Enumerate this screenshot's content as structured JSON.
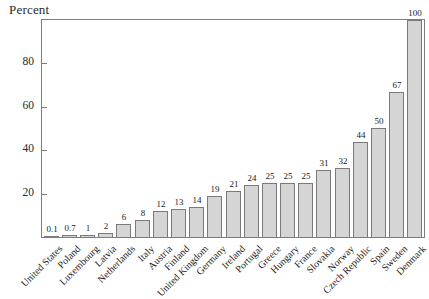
{
  "chart_data": {
    "type": "bar",
    "title": "",
    "xlabel": "",
    "ylabel": "Percent",
    "categories": [
      "United States",
      "Poland",
      "Luxembourg",
      "Latvia",
      "Netherlands",
      "Italy",
      "Austria",
      "Finland",
      "United Kingdom",
      "Germany",
      "Ireland",
      "Portugal",
      "Greece",
      "Hungary",
      "France",
      "Slovakia",
      "Norway",
      "Czech Republic",
      "Spain",
      "Sweden",
      "Denmark"
    ],
    "values": [
      0.1,
      0.7,
      1,
      2,
      6,
      8,
      12,
      13,
      14,
      19,
      21,
      24,
      25,
      25,
      25,
      31,
      32,
      44,
      50,
      67,
      100
    ],
    "bar_value_labels": [
      "0.1",
      "0.7",
      "1",
      "2",
      "6",
      "8",
      "12",
      "13",
      "14",
      "19",
      "21",
      "24",
      "25",
      "25",
      "25",
      "31",
      "32",
      "44",
      "50",
      "67",
      "100"
    ],
    "ylim": [
      0,
      100
    ],
    "yticks": [
      20,
      40,
      60,
      80
    ],
    "grid": false,
    "legend": "none",
    "x_label_rotation_deg": 45,
    "bar_fill": "#d5d5d5",
    "bar_stroke": "#7a7a7a",
    "frame_color": "#7d7d7d",
    "text_color": "#1a1a1a",
    "background_color": "#ffffff"
  }
}
